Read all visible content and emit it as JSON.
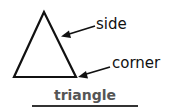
{
  "diagram": {
    "shape": "triangle",
    "labels": {
      "side": "side",
      "corner": "corner"
    },
    "caption": "triangle"
  }
}
